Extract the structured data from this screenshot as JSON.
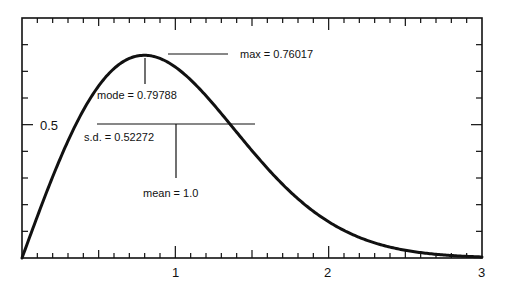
{
  "chart_data": {
    "type": "line",
    "title": "",
    "xlabel": "",
    "ylabel": "",
    "xlim": [
      0,
      3
    ],
    "ylim": [
      0,
      0.9
    ],
    "grid": false,
    "legend": null,
    "x_major_ticks": [
      {
        "value": 1,
        "label": "1"
      },
      {
        "value": 2,
        "label": "2"
      },
      {
        "value": 3,
        "label": "3"
      }
    ],
    "x_minor_tick_step": 0.1,
    "y_major_ticks": [
      {
        "value": 0.5,
        "label": "0.5"
      }
    ],
    "y_minor_tick_step": 0.1,
    "series": [
      {
        "name": "Rayleigh density (mean = 1)",
        "function": "f(x) = (x / s2) * exp(-x^2 / (2 * s2)), s2 = 2/pi",
        "sigma": 0.79788,
        "color": "#111111",
        "x": [
          0,
          0.1,
          0.2,
          0.3,
          0.4,
          0.5,
          0.6,
          0.7,
          0.79788,
          0.9,
          1.0,
          1.1,
          1.2,
          1.3,
          1.4,
          1.5,
          1.6,
          1.7,
          1.8,
          1.9,
          2.0,
          2.2,
          2.4,
          2.6,
          2.8,
          3.0
        ],
        "values": [
          0,
          0.155,
          0.302,
          0.438,
          0.555,
          0.646,
          0.713,
          0.751,
          0.76,
          0.743,
          0.714,
          0.665,
          0.608,
          0.54,
          0.471,
          0.403,
          0.337,
          0.276,
          0.223,
          0.176,
          0.136,
          0.077,
          0.041,
          0.02,
          0.009,
          0.004
        ]
      }
    ],
    "annotations": [
      {
        "id": "max",
        "text": "max = 0.76017",
        "value": 0.76017
      },
      {
        "id": "mode",
        "text": "mode = 0.79788",
        "value": 0.79788
      },
      {
        "id": "sd",
        "text": "s.d. = 0.52272",
        "value": 0.52272
      },
      {
        "id": "mean",
        "text": "mean = 1.0",
        "value": 1.0
      }
    ]
  },
  "labels": {
    "max": "max = 0.76017",
    "mode": "mode = 0.79788",
    "sd": "s.d. = 0.52272",
    "mean": "mean = 1.0",
    "y_half": "0.5",
    "x1": "1",
    "x2": "2",
    "x3": "3"
  }
}
